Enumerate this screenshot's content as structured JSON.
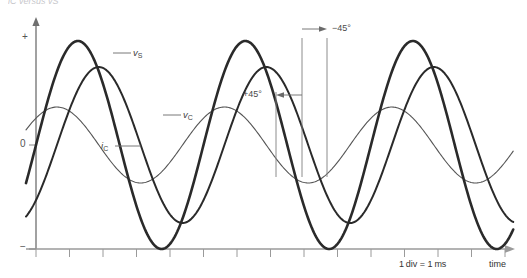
{
  "figure": {
    "caption_fragment": "i̅C versus v̅S",
    "background_color": "#ffffff"
  },
  "axes": {
    "y_axis": {
      "label_positive": "+",
      "label_zero": "0",
      "label_negative": "−",
      "color": "#555555"
    },
    "x_axis": {
      "label": "time",
      "scale_note": "1 div = 1 ms",
      "color": "#8a8a8a",
      "tick_count": 15
    }
  },
  "curves": [
    {
      "name": "source-voltage",
      "label": "v",
      "subscript": "S",
      "color": "#2a2a2a",
      "stroke_width": 2.6,
      "amplitude": 104,
      "phase_deg": 0,
      "description": "source voltage, largest amplitude, reference phase"
    },
    {
      "name": "capacitor-voltage",
      "label": "v",
      "subscript": "C",
      "color": "#2a2a2a",
      "stroke_width": 2.0,
      "amplitude": 78,
      "phase_deg": -45,
      "description": "capacitor voltage, lags source by 45 degrees"
    },
    {
      "name": "capacitor-current",
      "label": "i",
      "subscript": "C",
      "color": "#555555",
      "stroke_width": 1.1,
      "amplitude": 38,
      "phase_deg": 45,
      "description": "capacitor current, leads source by 45 degrees"
    }
  ],
  "annotations": {
    "lead_angle": "+45°",
    "lag_angle": "−45°",
    "marker_color": "#777777"
  },
  "chart_data": {
    "type": "line",
    "title": "",
    "xlabel": "time",
    "ylabel": "",
    "grid": false,
    "legend": "inline-labels",
    "x_unit": "ms",
    "x_note": "1 div = 1 ms",
    "period_ms": 5,
    "x_range_ms": [
      0,
      14.6
    ],
    "ytick_labels": [
      "+",
      "0",
      "−"
    ],
    "series": [
      {
        "name": "v_S",
        "label": "vₛ",
        "amplitude_rel": 1.0,
        "phase_deg": 0,
        "peaks_ms": [
          1.35,
          6.35,
          11.35
        ],
        "troughs_ms": [
          3.85,
          8.85,
          13.85
        ],
        "zero_crossings_ms": [
          0.1,
          2.6,
          5.1,
          7.6,
          10.1,
          12.6
        ]
      },
      {
        "name": "v_C",
        "label": "vᴄ",
        "amplitude_rel": 0.75,
        "phase_deg": -45,
        "peaks_ms": [
          1.98,
          6.98,
          11.98
        ],
        "troughs_ms": [
          4.48,
          9.48,
          13.48
        ],
        "zero_crossings_ms": [
          0.73,
          3.23,
          5.73,
          8.23,
          10.73,
          13.23
        ]
      },
      {
        "name": "i_C",
        "label": "iᴄ",
        "amplitude_rel": 0.365,
        "phase_deg": 45,
        "peaks_ms": [
          0.73,
          5.73,
          10.73
        ],
        "troughs_ms": [
          3.23,
          8.23,
          13.23
        ],
        "zero_crossings_ms": [
          2.0,
          4.5,
          7.0,
          9.5,
          12.0,
          14.5
        ]
      }
    ],
    "annotations": [
      {
        "text": "+45°",
        "at_ms": 5.73,
        "meaning": "i_C leads v_S by 45 degrees"
      },
      {
        "text": "−45°",
        "at_ms": 6.98,
        "meaning": "v_C lags v_S by 45 degrees"
      }
    ]
  }
}
